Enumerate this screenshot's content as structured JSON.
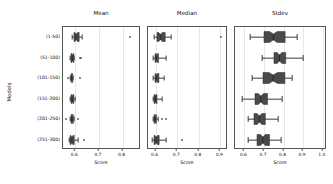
{
  "figure": {
    "ylabel": "Models",
    "categories": [
      "(1-50)",
      "(51-100)",
      "(101-150)",
      "(151-200)",
      "(201-250)",
      "(251-300)"
    ]
  },
  "chart_data": {
    "type": "box",
    "title": "",
    "ylabel": "Models",
    "orientation": "horizontal",
    "notched": true,
    "categories": [
      "(1-50)",
      "(51-100)",
      "(101-150)",
      "(151-200)",
      "(201-250)",
      "(251-300)"
    ],
    "panels": [
      {
        "title": "Mean",
        "xlabel": "Score",
        "xlim": [
          0.548,
          0.878
        ],
        "xticks": [
          0.6,
          0.7,
          0.8
        ],
        "xticklabels": [
          "0.6",
          "0.7",
          "0.8"
        ],
        "grid": true,
        "boxes": [
          {
            "category": "(1-50)",
            "whisker_low": 0.588,
            "q1": 0.596,
            "median": 0.605,
            "notch_low": 0.6,
            "notch_high": 0.61,
            "q3": 0.618,
            "whisker_high": 0.63,
            "outliers": [
              0.83
            ]
          },
          {
            "category": "(51-100)",
            "whisker_low": 0.578,
            "q1": 0.582,
            "median": 0.588,
            "notch_low": 0.585,
            "notch_high": 0.591,
            "q3": 0.594,
            "whisker_high": 0.596,
            "outliers": [
              0.62,
              0.626
            ]
          },
          {
            "category": "(101-150)",
            "whisker_low": 0.578,
            "q1": 0.58,
            "median": 0.583,
            "notch_low": 0.581,
            "notch_high": 0.585,
            "q3": 0.587,
            "whisker_high": 0.589,
            "outliers": [
              0.569,
              0.62
            ]
          },
          {
            "category": "(151-200)",
            "whisker_low": 0.576,
            "q1": 0.58,
            "median": 0.585,
            "notch_low": 0.582,
            "notch_high": 0.588,
            "q3": 0.592,
            "whisker_high": 0.6,
            "outliers": []
          },
          {
            "category": "(201-250)",
            "whisker_low": 0.578,
            "q1": 0.582,
            "median": 0.586,
            "notch_low": 0.584,
            "notch_high": 0.589,
            "q3": 0.592,
            "whisker_high": 0.596,
            "outliers": [
              0.56,
              0.612
            ]
          },
          {
            "category": "(251-300)",
            "whisker_low": 0.572,
            "q1": 0.578,
            "median": 0.586,
            "notch_low": 0.582,
            "notch_high": 0.59,
            "q3": 0.596,
            "whisker_high": 0.612,
            "outliers": [
              0.636
            ]
          }
        ]
      },
      {
        "title": "Median",
        "xlabel": "Score",
        "xlim": [
          0.565,
          0.935
        ],
        "xticks": [
          0.6,
          0.7,
          0.8,
          0.9
        ],
        "xticklabels": [
          "0.6",
          "0.7",
          "0.8",
          "0.9"
        ],
        "grid": true,
        "boxes": [
          {
            "category": "(1-50)",
            "whisker_low": 0.592,
            "q1": 0.608,
            "median": 0.624,
            "notch_low": 0.616,
            "notch_high": 0.632,
            "q3": 0.646,
            "whisker_high": 0.672,
            "outliers": [
              0.902
            ]
          },
          {
            "category": "(51-100)",
            "whisker_low": 0.588,
            "q1": 0.596,
            "median": 0.602,
            "notch_low": 0.599,
            "notch_high": 0.606,
            "q3": 0.612,
            "whisker_high": 0.648,
            "outliers": []
          },
          {
            "category": "(101-150)",
            "whisker_low": 0.59,
            "q1": 0.598,
            "median": 0.604,
            "notch_low": 0.601,
            "notch_high": 0.608,
            "q3": 0.616,
            "whisker_high": 0.638,
            "outliers": []
          },
          {
            "category": "(151-200)",
            "whisker_low": 0.586,
            "q1": 0.592,
            "median": 0.598,
            "notch_low": 0.595,
            "notch_high": 0.601,
            "q3": 0.606,
            "whisker_high": 0.63,
            "outliers": []
          },
          {
            "category": "(201-250)",
            "whisker_low": 0.588,
            "q1": 0.592,
            "median": 0.597,
            "notch_low": 0.594,
            "notch_high": 0.6,
            "q3": 0.603,
            "whisker_high": 0.61,
            "outliers": [
              0.632,
              0.648
            ]
          },
          {
            "category": "(251-300)",
            "whisker_low": 0.584,
            "q1": 0.594,
            "median": 0.604,
            "notch_low": 0.599,
            "notch_high": 0.609,
            "q3": 0.618,
            "whisker_high": 0.648,
            "outliers": [
              0.722
            ]
          }
        ]
      },
      {
        "title": "Stdev",
        "xlabel": "Score",
        "xlim": [
          0.552,
          1.022
        ],
        "xticks": [
          0.6,
          0.7,
          0.8,
          0.9,
          1.0
        ],
        "xticklabels": [
          "0.6",
          "0.7",
          "0.8",
          "0.9",
          "1.0"
        ],
        "grid": true,
        "boxes": [
          {
            "category": "(1-50)",
            "whisker_low": 0.63,
            "q1": 0.7,
            "median": 0.748,
            "notch_low": 0.728,
            "notch_high": 0.768,
            "q3": 0.808,
            "whisker_high": 0.868,
            "outliers": []
          },
          {
            "category": "(51-100)",
            "whisker_low": 0.69,
            "q1": 0.752,
            "median": 0.78,
            "notch_low": 0.768,
            "notch_high": 0.792,
            "q3": 0.812,
            "whisker_high": 0.898,
            "outliers": []
          },
          {
            "category": "(101-150)",
            "whisker_low": 0.64,
            "q1": 0.696,
            "median": 0.748,
            "notch_low": 0.726,
            "notch_high": 0.77,
            "q3": 0.808,
            "whisker_high": 0.842,
            "outliers": []
          },
          {
            "category": "(151-200)",
            "whisker_low": 0.588,
            "q1": 0.654,
            "median": 0.684,
            "notch_low": 0.67,
            "notch_high": 0.698,
            "q3": 0.718,
            "whisker_high": 0.794,
            "outliers": []
          },
          {
            "category": "(201-250)",
            "whisker_low": 0.618,
            "q1": 0.648,
            "median": 0.676,
            "notch_low": 0.664,
            "notch_high": 0.688,
            "q3": 0.706,
            "whisker_high": 0.772,
            "outliers": []
          },
          {
            "category": "(251-300)",
            "whisker_low": 0.616,
            "q1": 0.662,
            "median": 0.692,
            "notch_low": 0.68,
            "notch_high": 0.704,
            "q3": 0.726,
            "whisker_high": 0.788,
            "outliers": []
          }
        ]
      }
    ],
    "style": {
      "box_fill": "#4a4a4a",
      "box_edge": "#2b2b2b",
      "whisker_color": "#3a3a3a",
      "grid_color": "#e8e8e8",
      "axis_color": "#555555"
    }
  }
}
